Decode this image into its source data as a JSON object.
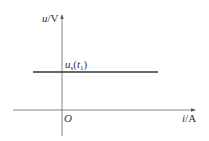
{
  "diagram": {
    "type": "u-i characteristic graph",
    "y_axis": {
      "var": "u",
      "unit": "V"
    },
    "x_axis": {
      "var": "i",
      "unit": "A"
    },
    "origin_label": "O",
    "line_label": {
      "base": "u",
      "sub": "s",
      "arg_open": "(",
      "arg": "t",
      "arg_sub": "1",
      "arg_close": ")"
    },
    "colors": {
      "axis": "#555555",
      "line": "#333333",
      "text": "#333333"
    }
  }
}
